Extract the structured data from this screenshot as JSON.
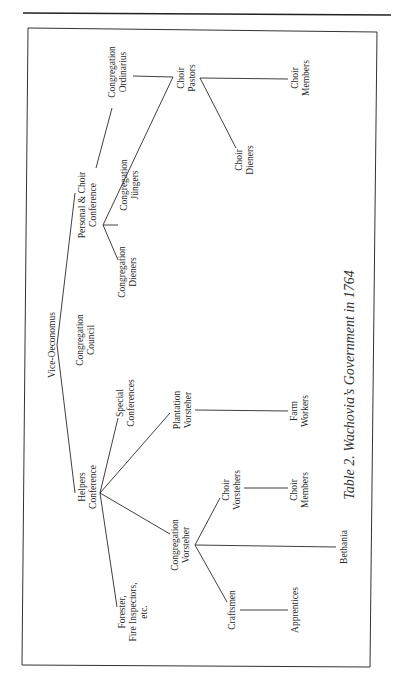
{
  "document": {
    "caption": "Table 2. Wachovia’s Government in 1764"
  },
  "diagram": {
    "nodes": {
      "vice_oeconomus": {
        "line1": "Vice-Oeconomus"
      },
      "congregation_council": {
        "line1": "Congregation",
        "line2": "Council"
      },
      "personal_choir_conference": {
        "line1": "Personal & Choir",
        "line2": "Conference"
      },
      "congregation_ordinarius": {
        "line1": "Congregation",
        "line2": "Ordinarius"
      },
      "congregation_jungers": {
        "line1": "Congregation",
        "line2": "Jüngers"
      },
      "congregation_dieners": {
        "line1": "Congregation",
        "line2": "Dieners"
      },
      "choir_pastors": {
        "line1": "Choir",
        "line2": "Pastors"
      },
      "choir_diener": {
        "line1": "Choir",
        "line2": "Dieners"
      },
      "choir_members_top": {
        "line1": "Choir",
        "line2": "Members"
      },
      "helpers_conference": {
        "line1": "Helpers",
        "line2": "Conference"
      },
      "special_conferences": {
        "line1": "Special",
        "line2": "Conferences"
      },
      "plantation_vorsteher": {
        "line1": "Plantation",
        "line2": "Vorsteher"
      },
      "farm_workers": {
        "line1": "Farm",
        "line2": "Workers"
      },
      "congregation_vorsteher": {
        "line1": "Congregation",
        "line2": "Vorsteher"
      },
      "choir_vorstehers": {
        "line1": "Choir",
        "line2": "Vorstehers"
      },
      "choir_members_bottom": {
        "line1": "Choir",
        "line2": "Members"
      },
      "bethania": {
        "line1": "Bethania"
      },
      "forester": {
        "line1": "Forester,",
        "line2": "Fire Inspectors,",
        "line3": "etc."
      },
      "craftsmen": {
        "line1": "Craftsmen"
      },
      "apprentices": {
        "line1": "Apprentices"
      }
    },
    "edges": [
      [
        "vice_oeconomus",
        "personal_choir_conference"
      ],
      [
        "vice_oeconomus",
        "helpers_conference"
      ],
      [
        "personal_choir_conference",
        "congregation_ordinarius"
      ],
      [
        "personal_choir_conference",
        "congregation_jungers"
      ],
      [
        "personal_choir_conference",
        "congregation_dieners"
      ],
      [
        "personal_choir_conference",
        "choir_pastors"
      ],
      [
        "congregation_ordinarius",
        "choir_pastors"
      ],
      [
        "choir_pastors",
        "choir_members_top"
      ],
      [
        "choir_pastors",
        "choir_diener"
      ],
      [
        "helpers_conference",
        "special_conferences"
      ],
      [
        "helpers_conference",
        "plantation_vorsteher"
      ],
      [
        "helpers_conference",
        "congregation_vorsteher"
      ],
      [
        "helpers_conference",
        "forester"
      ],
      [
        "plantation_vorsteher",
        "farm_workers"
      ],
      [
        "congregation_vorsteher",
        "choir_vorstehers"
      ],
      [
        "congregation_vorsteher",
        "bethania"
      ],
      [
        "congregation_vorsteher",
        "craftsmen"
      ],
      [
        "choir_vorstehers",
        "choir_members_bottom"
      ],
      [
        "craftsmen",
        "apprentices"
      ]
    ]
  }
}
